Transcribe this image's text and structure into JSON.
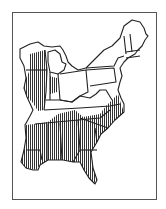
{
  "map": {
    "type": "range-map",
    "region": "Eastern United States",
    "legend": [],
    "hatch_color": "#333333",
    "border_color": "#222222",
    "background": "#ffffff",
    "range_pattern": "vertical-hatching",
    "range_states": [
      "Wisconsin (west)",
      "Illinois",
      "Indiana (west)",
      "Tennessee (south)",
      "North Carolina",
      "South Carolina",
      "Georgia",
      "Alabama",
      "Mississippi",
      "Louisiana (east)",
      "Florida",
      "Virginia (east)"
    ]
  }
}
